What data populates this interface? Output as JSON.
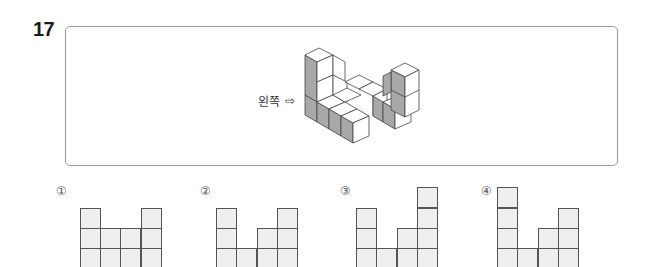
{
  "question": {
    "number": "17",
    "direction_label": "왼쪽",
    "direction_arrow": "⇨"
  },
  "options": [
    {
      "label": "①",
      "columns": [
        3,
        2,
        2,
        3
      ]
    },
    {
      "label": "②",
      "columns": [
        3,
        1,
        2,
        3
      ]
    },
    {
      "label": "③",
      "columns": [
        3,
        1,
        2,
        4
      ]
    },
    {
      "label": "④",
      "columns": [
        4,
        1,
        2,
        3
      ]
    }
  ],
  "colors": {
    "cell_fill": "#efefef",
    "cell_border": "#555555",
    "frame_border": "#9a9a9a",
    "shade": "#a8a8a8"
  }
}
